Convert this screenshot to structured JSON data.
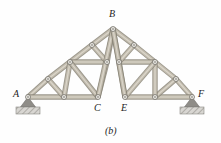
{
  "figure": {
    "caption": "(b)",
    "caption_pos": [
      105,
      126
    ],
    "type": "structural-truss-diagram",
    "background": "#fefefe",
    "member_color": "#b2ab9e",
    "member_edge": "#8d8madd",
    "joint_fill": "#e8e6e0",
    "joint_stroke": "#7d7a72",
    "support_color": "#8f8d88",
    "hatch_color": "#a9a7a2"
  },
  "labels": [
    {
      "text": "A",
      "x": 13,
      "y": 89,
      "name": "joint-label-A"
    },
    {
      "text": "B",
      "x": 109,
      "y": 9,
      "name": "joint-label-B"
    },
    {
      "text": "C",
      "x": 94,
      "y": 103,
      "name": "joint-label-C"
    },
    {
      "text": "E",
      "x": 121,
      "y": 103,
      "name": "joint-label-E"
    },
    {
      "text": "F",
      "x": 198,
      "y": 89,
      "name": "joint-label-F"
    }
  ],
  "geometry": {
    "nodes": {
      "A": [
        28,
        97
      ],
      "L1": [
        64,
        97
      ],
      "C": [
        98,
        97
      ],
      "E": [
        125,
        97
      ],
      "R1": [
        155,
        97
      ],
      "F": [
        192,
        97
      ],
      "B": [
        113,
        29
      ],
      "LR1": [
        48,
        79
      ],
      "LR2": [
        70,
        62
      ],
      "LR3": [
        92,
        45
      ],
      "RR3": [
        134,
        45
      ],
      "RR2": [
        155,
        62
      ],
      "RR1": [
        176,
        79
      ],
      "LM1": [
        70,
        62
      ],
      "LM2": [
        107,
        62
      ],
      "RM1": [
        119,
        62
      ],
      "RM2": [
        155,
        62
      ]
    },
    "members": [
      {
        "from": "A",
        "to": "LR1",
        "name": "member-A-LR1"
      },
      {
        "from": "LR1",
        "to": "LR2",
        "name": "member-LR1-LR2"
      },
      {
        "from": "LR2",
        "to": "LR3",
        "name": "member-LR2-LR3"
      },
      {
        "from": "LR3",
        "to": "B",
        "name": "member-LR3-B"
      },
      {
        "from": "B",
        "to": "RR3",
        "name": "member-B-RR3"
      },
      {
        "from": "RR3",
        "to": "RR2",
        "name": "member-RR3-RR2"
      },
      {
        "from": "RR2",
        "to": "RR1",
        "name": "member-RR2-RR1"
      },
      {
        "from": "RR1",
        "to": "F",
        "name": "member-RR1-F"
      },
      {
        "from": "A",
        "to": "L1",
        "name": "member-A-L1"
      },
      {
        "from": "L1",
        "to": "C",
        "name": "member-L1-C"
      },
      {
        "from": "E",
        "to": "R1",
        "name": "member-E-R1"
      },
      {
        "from": "R1",
        "to": "F",
        "name": "member-R1-F"
      },
      {
        "from": "LR2",
        "to": "LM2",
        "name": "member-LR2-LM2"
      },
      {
        "from": "RM1",
        "to": "RR2",
        "name": "member-RM1-RR2"
      },
      {
        "from": "LR1",
        "to": "L1",
        "name": "member-LR1-L1"
      },
      {
        "from": "LR2",
        "to": "L1",
        "name": "member-LR2-L1"
      },
      {
        "from": "LR2",
        "to": "C",
        "name": "member-LR2-C"
      },
      {
        "from": "LM2",
        "to": "C",
        "name": "member-LM2-C"
      },
      {
        "from": "LR3",
        "to": "LM2",
        "name": "member-LR3-LM2"
      },
      {
        "from": "B",
        "to": "LM2",
        "name": "member-B-LM2"
      },
      {
        "from": "B",
        "to": "C",
        "name": "member-B-C"
      },
      {
        "from": "RR1",
        "to": "R1",
        "name": "member-RR1-R1"
      },
      {
        "from": "RR2",
        "to": "R1",
        "name": "member-RR2-R1"
      },
      {
        "from": "RR2",
        "to": "E",
        "name": "member-RR2-E"
      },
      {
        "from": "RM1",
        "to": "E",
        "name": "member-RM1-E"
      },
      {
        "from": "RR3",
        "to": "RM1",
        "name": "member-RR3-RM1"
      },
      {
        "from": "B",
        "to": "RM1",
        "name": "member-B-RM1"
      },
      {
        "from": "B",
        "to": "E",
        "name": "member-B-E"
      }
    ],
    "joints": [
      {
        "at": "A",
        "name": "joint-A"
      },
      {
        "at": "L1",
        "name": "joint-L1"
      },
      {
        "at": "C",
        "name": "joint-C"
      },
      {
        "at": "E",
        "name": "joint-E"
      },
      {
        "at": "R1",
        "name": "joint-R1"
      },
      {
        "at": "F",
        "name": "joint-F"
      },
      {
        "at": "B",
        "name": "joint-B"
      },
      {
        "at": "LR1",
        "name": "joint-LR1"
      },
      {
        "at": "LR2",
        "name": "joint-LR2"
      },
      {
        "at": "LR3",
        "name": "joint-LR3"
      },
      {
        "at": "RR3",
        "name": "joint-RR3"
      },
      {
        "at": "RR2",
        "name": "joint-RR2"
      },
      {
        "at": "RR1",
        "name": "joint-RR1"
      },
      {
        "at": "LM2",
        "name": "joint-LM2"
      },
      {
        "at": "RM1",
        "name": "joint-RM1"
      }
    ],
    "supports": [
      {
        "at": "A",
        "kind": "pin",
        "name": "support-pin-A"
      },
      {
        "at": "F",
        "kind": "pin",
        "name": "support-pin-F"
      }
    ]
  }
}
